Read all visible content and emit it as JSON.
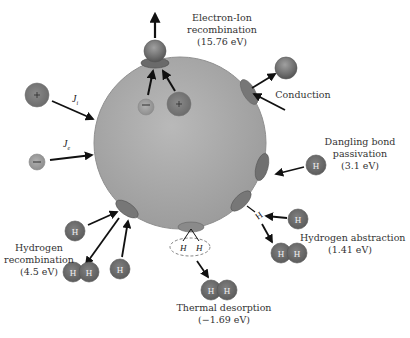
{
  "diagram": {
    "colors": {
      "sphere": "#a7a7a7",
      "site": "#7a7a7a",
      "hydrogen": "#6e6e6e",
      "arrow": "#111111",
      "text": "#333333"
    },
    "fluxes": {
      "ion_flux": {
        "symbol": "J",
        "subscript": "i",
        "particle_sign": "+"
      },
      "electron_flux": {
        "symbol": "J",
        "subscript": "e",
        "particle_sign": "−"
      }
    },
    "processes": {
      "electron_ion_recombination": {
        "line1": "Electron-Ion",
        "line2": "recombination",
        "energy": "(15.76 eV)"
      },
      "conduction": {
        "line1": "Conduction"
      },
      "dangling_bond_passivation": {
        "line1": "Dangling bond",
        "line2": "passivation",
        "energy": "(3.1 eV)"
      },
      "hydrogen_abstraction": {
        "line1": "Hydrogen abstraction",
        "energy": "(1.41 eV)"
      },
      "thermal_desorption": {
        "line1": "Thermal desorption",
        "energy": "(−1.69 eV)"
      },
      "hydrogen_recombination": {
        "line1": "Hydrogen",
        "line2": "recombination",
        "energy": "(4.5 eV)"
      }
    },
    "atoms": {
      "hydrogen_label": "H",
      "plus": "+",
      "minus": "−"
    }
  }
}
